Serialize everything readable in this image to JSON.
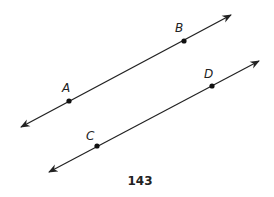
{
  "figure": {
    "caption": "143",
    "line_color": "#222222",
    "lines": [
      {
        "name": "line-AB",
        "x1": 21,
        "y1": 127,
        "x2": 231,
        "y2": 15,
        "points": [
          {
            "label": "A",
            "x": 69,
            "y": 101,
            "lx": 62,
            "ly": 92
          },
          {
            "label": "B",
            "x": 184,
            "y": 41,
            "lx": 175,
            "ly": 32
          }
        ]
      },
      {
        "name": "line-CD",
        "x1": 49,
        "y1": 172,
        "x2": 259,
        "y2": 61,
        "points": [
          {
            "label": "C",
            "x": 97,
            "y": 146,
            "lx": 86,
            "ly": 140
          },
          {
            "label": "D",
            "x": 212,
            "y": 86,
            "lx": 204,
            "ly": 78
          }
        ]
      }
    ]
  }
}
